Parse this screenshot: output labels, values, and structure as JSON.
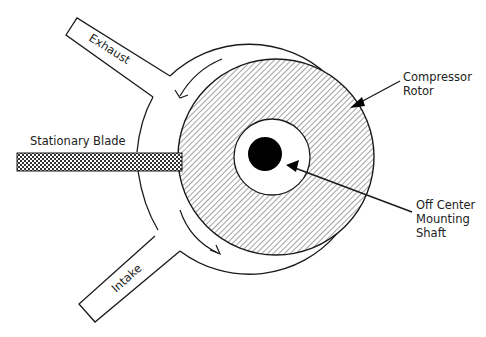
{
  "diagram": {
    "type": "rotary vane compressor cross-section",
    "labels": {
      "exhaust": "Exhaust",
      "intake": "Intake",
      "stationary_blade": "Stationary Blade",
      "compressor_rotor_line1": "Compressor",
      "compressor_rotor_line2": "Rotor",
      "shaft_line1": "Off Center",
      "shaft_line2": "Mounting",
      "shaft_line3": "Shaft"
    },
    "colors": {
      "line": "#1a1a1a",
      "background": "#ffffff",
      "shaft": "#000000"
    }
  }
}
